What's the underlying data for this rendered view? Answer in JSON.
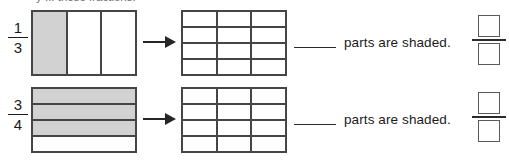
{
  "worksheet": {
    "partial_instruction": "y  ...  these fractions.",
    "sentence_text": "parts are shaded.",
    "blank_placeholder": "",
    "colors": {
      "shade": "#d2d2d2",
      "border": "#454545",
      "text": "#1a1a1a",
      "arrow": "#262626"
    },
    "problems": [
      {
        "fraction": {
          "numerator": "1",
          "denominator": "3"
        },
        "model": {
          "orientation": "vertical",
          "total_parts": 3,
          "shaded_parts": 1,
          "shaded_indices": [
            0
          ]
        },
        "target_grid": {
          "columns": 3,
          "rows": 4,
          "total_cells": 12,
          "shaded_cells": 0
        },
        "answer": {
          "blank": "",
          "numerator_box": "",
          "denominator_box": ""
        }
      },
      {
        "fraction": {
          "numerator": "3",
          "denominator": "4"
        },
        "model": {
          "orientation": "horizontal",
          "total_parts": 4,
          "shaded_parts": 3,
          "shaded_indices": [
            0,
            1,
            2
          ]
        },
        "target_grid": {
          "columns": 3,
          "rows": 4,
          "total_cells": 12,
          "shaded_cells": 0
        },
        "answer": {
          "blank": "",
          "numerator_box": "",
          "denominator_box": ""
        }
      }
    ]
  }
}
